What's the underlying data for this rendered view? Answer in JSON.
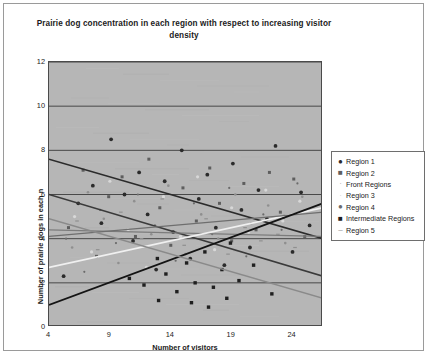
{
  "chart_data": {
    "type": "scatter",
    "title": "Prairie dog concentration in each region with respect to increasing visitor density",
    "xlabel": "Number of visitors",
    "ylabel": "Number of prairie dogs in each n",
    "xlim": [
      4,
      26.5
    ],
    "ylim": [
      0,
      12
    ],
    "xticks": [
      4,
      9,
      14,
      19,
      24
    ],
    "yticks": [
      0,
      2,
      4,
      6,
      8,
      10,
      12
    ],
    "grid": "horizontal",
    "legend_position": "right",
    "plot_background": "#b6b6b6",
    "series": [
      {
        "name": "Region 1",
        "marker": "filled-circle",
        "color": "#2b2b2b",
        "points": [
          [
            5.2,
            2.3
          ],
          [
            6.4,
            5.6
          ],
          [
            7.6,
            6.4
          ],
          [
            8.3,
            4.7
          ],
          [
            9.1,
            8.5
          ],
          [
            10.2,
            6.0
          ],
          [
            10.9,
            3.9
          ],
          [
            11.4,
            7.0
          ],
          [
            12.1,
            5.1
          ],
          [
            12.8,
            2.6
          ],
          [
            13.5,
            6.6
          ],
          [
            14.2,
            4.3
          ],
          [
            14.9,
            8.0
          ],
          [
            15.6,
            3.1
          ],
          [
            16.3,
            5.8
          ],
          [
            17.0,
            6.9
          ],
          [
            17.7,
            4.5
          ],
          [
            18.4,
            2.8
          ],
          [
            19.1,
            7.4
          ],
          [
            19.8,
            5.3
          ],
          [
            20.5,
            3.6
          ],
          [
            21.2,
            6.2
          ],
          [
            21.9,
            4.9
          ],
          [
            22.6,
            8.2
          ],
          [
            23.3,
            5.0
          ],
          [
            24.0,
            3.4
          ],
          [
            24.7,
            6.1
          ],
          [
            25.4,
            4.6
          ]
        ],
        "trend": {
          "x0": 4,
          "y0": 7.6,
          "x1": 26.5,
          "y1": 4.0,
          "color": "#2b2b2b",
          "width": 1.6
        }
      },
      {
        "name": "Region 2",
        "marker": "filled-square",
        "color": "#5e5e5e",
        "points": [
          [
            5.6,
            4.5
          ],
          [
            6.8,
            7.1
          ],
          [
            7.9,
            3.2
          ],
          [
            8.9,
            5.9
          ],
          [
            10.0,
            6.8
          ],
          [
            11.1,
            4.1
          ],
          [
            12.2,
            7.6
          ],
          [
            13.1,
            5.4
          ],
          [
            14.0,
            3.7
          ],
          [
            15.0,
            6.3
          ],
          [
            16.1,
            4.8
          ],
          [
            17.2,
            7.2
          ],
          [
            18.0,
            5.6
          ],
          [
            19.0,
            3.9
          ],
          [
            20.0,
            6.5
          ],
          [
            21.0,
            4.4
          ],
          [
            22.1,
            7.0
          ],
          [
            23.0,
            5.2
          ],
          [
            24.1,
            6.7
          ],
          [
            25.0,
            4.1
          ]
        ],
        "trend": {
          "x0": 4,
          "y0": 6.0,
          "x1": 26.5,
          "y1": 2.3,
          "color": "#3a3a3a",
          "width": 1.5
        }
      },
      {
        "name": "Front Regions",
        "marker": "small-dot",
        "color": "#8f8f8f",
        "points": [
          [
            5.9,
            3.6
          ],
          [
            7.2,
            6.1
          ],
          [
            8.5,
            4.9
          ],
          [
            9.7,
            2.9
          ],
          [
            11.0,
            5.7
          ],
          [
            12.4,
            4.2
          ],
          [
            13.8,
            6.4
          ],
          [
            15.2,
            3.3
          ],
          [
            16.5,
            5.1
          ],
          [
            17.9,
            4.0
          ],
          [
            19.3,
            6.0
          ],
          [
            20.6,
            4.7
          ],
          [
            22.0,
            5.5
          ],
          [
            23.4,
            3.8
          ],
          [
            24.8,
            5.9
          ]
        ],
        "trend": {
          "x0": 4,
          "y0": 4.4,
          "x1": 26.5,
          "y1": 4.1,
          "color": "#7c7c7c",
          "width": 1.3
        }
      },
      {
        "name": "Region 3",
        "marker": "light-dot",
        "color": "#d8d8d8",
        "points": [
          [
            6.1,
            5.0
          ],
          [
            7.5,
            3.4
          ],
          [
            9.0,
            6.6
          ],
          [
            10.5,
            4.4
          ],
          [
            12.0,
            2.7
          ],
          [
            13.4,
            5.9
          ],
          [
            14.8,
            4.1
          ],
          [
            16.2,
            6.8
          ],
          [
            17.6,
            3.5
          ],
          [
            19.0,
            5.4
          ],
          [
            20.4,
            4.3
          ],
          [
            21.8,
            6.2
          ],
          [
            23.2,
            4.8
          ],
          [
            24.6,
            5.7
          ]
        ],
        "trend": {
          "x0": 4,
          "y0": 2.7,
          "x1": 26.5,
          "y1": 5.4,
          "color": "#f0f0f0",
          "width": 1.7
        }
      },
      {
        "name": "Region 4",
        "marker": "tiny-dot",
        "color": "#6b6b6b",
        "points": [
          [
            5.4,
            4.0
          ],
          [
            6.9,
            2.5
          ],
          [
            8.2,
            5.3
          ],
          [
            9.5,
            3.8
          ],
          [
            11.3,
            6.0
          ],
          [
            12.7,
            4.6
          ],
          [
            14.4,
            3.0
          ],
          [
            15.9,
            5.6
          ],
          [
            17.4,
            4.2
          ],
          [
            18.8,
            6.3
          ],
          [
            20.2,
            3.2
          ],
          [
            21.6,
            5.1
          ],
          [
            23.1,
            4.4
          ],
          [
            24.4,
            6.5
          ]
        ],
        "trend": {
          "x0": 4,
          "y0": 4.1,
          "x1": 26.5,
          "y1": 5.2,
          "color": "#6e6e6e",
          "width": 1.3
        }
      },
      {
        "name": "Intermediate Regions",
        "marker": "filled-square-dark",
        "color": "#1f1f1f",
        "points": [
          [
            10.6,
            2.2
          ],
          [
            11.8,
            1.9
          ],
          [
            12.9,
            3.1
          ],
          [
            13.6,
            2.4
          ],
          [
            14.5,
            1.6
          ],
          [
            15.3,
            2.9
          ],
          [
            16.0,
            2.0
          ],
          [
            16.8,
            3.4
          ],
          [
            17.5,
            1.8
          ],
          [
            18.2,
            2.6
          ],
          [
            18.9,
            3.8
          ],
          [
            19.6,
            2.1
          ],
          [
            20.8,
            2.8
          ],
          [
            22.3,
            1.5
          ],
          [
            13.0,
            1.2
          ],
          [
            15.7,
            1.1
          ],
          [
            17.1,
            0.9
          ],
          [
            18.6,
            1.3
          ]
        ],
        "trend": {
          "x0": 4,
          "y0": 1.0,
          "x1": 26.5,
          "y1": 5.6,
          "color": "#141414",
          "width": 1.9
        }
      },
      {
        "name": "Region 5",
        "marker": "dash",
        "color": "#909090",
        "points": [
          [
            6.3,
            4.8
          ],
          [
            8.0,
            3.5
          ],
          [
            9.9,
            5.2
          ],
          [
            11.6,
            4.0
          ],
          [
            13.3,
            5.8
          ],
          [
            15.1,
            3.7
          ],
          [
            16.9,
            4.9
          ],
          [
            18.7,
            3.3
          ],
          [
            20.1,
            4.5
          ],
          [
            21.4,
            3.9
          ],
          [
            22.8,
            4.2
          ],
          [
            24.2,
            3.6
          ]
        ],
        "trend": {
          "x0": 4,
          "y0": 4.9,
          "x1": 26.5,
          "y1": 1.3,
          "color": "#8a8a8a",
          "width": 1.4
        }
      }
    ]
  },
  "legend": {
    "entries": [
      {
        "label": "Region 1",
        "glyph": "●",
        "color": "#2b2b2b"
      },
      {
        "label": "Region 2",
        "glyph": "■",
        "color": "#5e5e5e"
      },
      {
        "label": "Front Regions",
        "glyph": "·",
        "color": "#a8a8a8"
      },
      {
        "label": "Region 3",
        "glyph": "·",
        "color": "#cfcfcf"
      },
      {
        "label": "Region 4",
        "glyph": "●",
        "color": "#6b6b6b"
      },
      {
        "label": "Intermediate Regions",
        "glyph": "■",
        "color": "#1f1f1f"
      },
      {
        "label": "Region 5",
        "glyph": "–",
        "color": "#909090"
      }
    ]
  }
}
